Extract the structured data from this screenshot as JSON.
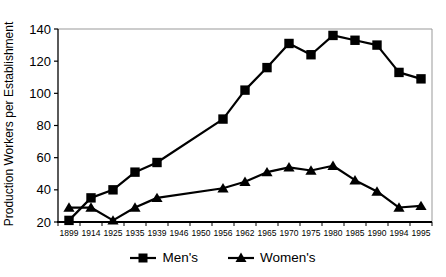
{
  "chart_data": {
    "type": "line",
    "title": "",
    "xlabel": "",
    "ylabel": "Production Workers per Establishment",
    "ylim": [
      20,
      140
    ],
    "ytick_step": 20,
    "grid": false,
    "legend_position": "bottom",
    "marker_color": "#000000",
    "frame_color": "#999999",
    "axis_color": "#000000",
    "categories": [
      "1899",
      "1914",
      "1925",
      "1935",
      "1939",
      "1946",
      "1950",
      "1956",
      "1962",
      "1965",
      "1970",
      "1975",
      "1980",
      "1985",
      "1990",
      "1994",
      "1995"
    ],
    "series": [
      {
        "name": "Men's",
        "marker": "square",
        "color": "#000000",
        "values": [
          21,
          35,
          40,
          51,
          57,
          null,
          null,
          84,
          102,
          116,
          131,
          124,
          136,
          133,
          130,
          113,
          109
        ]
      },
      {
        "name": "Women's",
        "marker": "triangle",
        "color": "#000000",
        "values": [
          29,
          29,
          21,
          29,
          35,
          null,
          null,
          41,
          45,
          51,
          54,
          52,
          55,
          46,
          39,
          29,
          30
        ]
      }
    ]
  }
}
